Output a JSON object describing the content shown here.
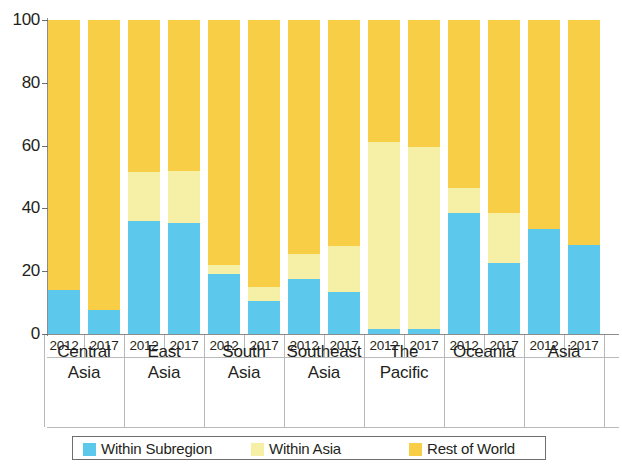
{
  "chart_data": {
    "type": "bar",
    "subtype": "stacked-100-percent",
    "title": "",
    "xlabel": "",
    "ylabel": "",
    "ylim": [
      0,
      100
    ],
    "y_ticks": [
      0,
      20,
      40,
      60,
      80,
      100
    ],
    "grid": false,
    "legend_position": "bottom",
    "categories": [
      "Central Asia 2012",
      "Central Asia 2017",
      "East Asia 2012",
      "East Asia 2017",
      "South Asia 2012",
      "South Asia 2017",
      "Southeast Asia 2012",
      "Southeast Asia 2017",
      "The Pacific 2012",
      "The Pacific 2017",
      "Oceania 2012",
      "Oceania 2017",
      "Asia 2012",
      "Asia 2017"
    ],
    "groups": [
      {
        "region": "Central",
        "region_line2": "Asia",
        "years": [
          "2012",
          "2017"
        ]
      },
      {
        "region": "East",
        "region_line2": "Asia",
        "years": [
          "2012",
          "2017"
        ]
      },
      {
        "region": "South",
        "region_line2": "Asia",
        "years": [
          "2012",
          "2017"
        ]
      },
      {
        "region": "Southeast",
        "region_line2": "Asia",
        "years": [
          "2012",
          "2017"
        ]
      },
      {
        "region": "The",
        "region_line2": "Pacific",
        "years": [
          "2012",
          "2017"
        ]
      },
      {
        "region": "Oceania",
        "region_line2": "",
        "years": [
          "2012",
          "2017"
        ]
      },
      {
        "region": "Asia",
        "region_line2": "",
        "years": [
          "2012",
          "2017"
        ]
      }
    ],
    "series": [
      {
        "name": "Within Subregion",
        "color": "#5cc8ec",
        "values": [
          14,
          7.5,
          36,
          35.5,
          19,
          10.5,
          17.5,
          13.5,
          1.5,
          1.5,
          38.5,
          22.5,
          33.5,
          28.5
        ]
      },
      {
        "name": "Within Asia",
        "color": "#f6f0a6",
        "values": [
          0,
          0,
          15.5,
          16.5,
          3,
          4.5,
          8,
          14.5,
          59.5,
          58,
          8,
          16,
          0,
          0
        ]
      },
      {
        "name": "Rest of World",
        "color": "#f8ce46",
        "values": [
          86,
          92.5,
          48.5,
          48,
          78,
          85,
          74.5,
          72,
          39,
          40.5,
          53.5,
          61.5,
          66.5,
          71.5
        ]
      }
    ]
  },
  "legend": {
    "items": [
      {
        "label": "Within Subregion",
        "color": "#5cc8ec"
      },
      {
        "label": "Within Asia",
        "color": "#f6f0a6"
      },
      {
        "label": "Rest of World",
        "color": "#f8ce46"
      }
    ]
  }
}
